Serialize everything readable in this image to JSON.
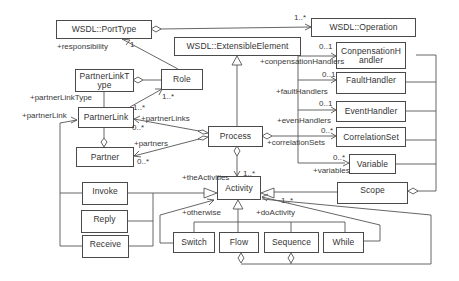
{
  "diagram": {
    "type": "UML class diagram",
    "classes": {
      "port_type": "WSDL::PortType",
      "operation": "WSDL::Operation",
      "extensible_element": "WSDL::ExtensibleElement",
      "partner_link_type_1": "PartnerLinkT",
      "partner_link_type_2": "ype",
      "role": "Role",
      "partner_link": "PartnerLink",
      "partner": "Partner",
      "process": "Process",
      "compensation_handler_1": "ConpensationH",
      "compensation_handler_2": "andler",
      "fault_handler": "FaultHandler",
      "event_handler": "EventHandler",
      "correlation_set": "CorrelationSet",
      "variable": "Variable",
      "scope": "Scope",
      "activity": "Activity",
      "invoke": "Invoke",
      "reply": "Reply",
      "receive": "Receive",
      "switch": "Switch",
      "flow": "Flow",
      "sequence": "Sequence",
      "while": "While"
    },
    "roles": {
      "responsibility": "+responsibility",
      "partner_link_type": "+partnerLinkType",
      "partner_link": "+partnerLink",
      "partner_links": "+partnerLinks",
      "partners": "+partners",
      "compensation_handlers": "+conpensationHandlers",
      "fault_handlers": "+faultHandlers",
      "event_handlers": "+evenHandlers",
      "correlation_sets": "+correlationSets",
      "variables": "+variables",
      "the_activities": "+theActivities",
      "otherwise": "+otherwise",
      "do_activity": "+doActivity"
    },
    "multiplicities": {
      "operation": "1..*",
      "port_type_one": "1",
      "role_many": "1..*",
      "partner_link_to_role": "1..*",
      "partner_links_many": "0..*",
      "partners_many": "0..*",
      "compensation": "0..1",
      "fault": "0..1",
      "event": "0..1",
      "correlation": "0..*",
      "variables": "0..*",
      "activities": "1..*",
      "do_activity": "1..*"
    }
  }
}
